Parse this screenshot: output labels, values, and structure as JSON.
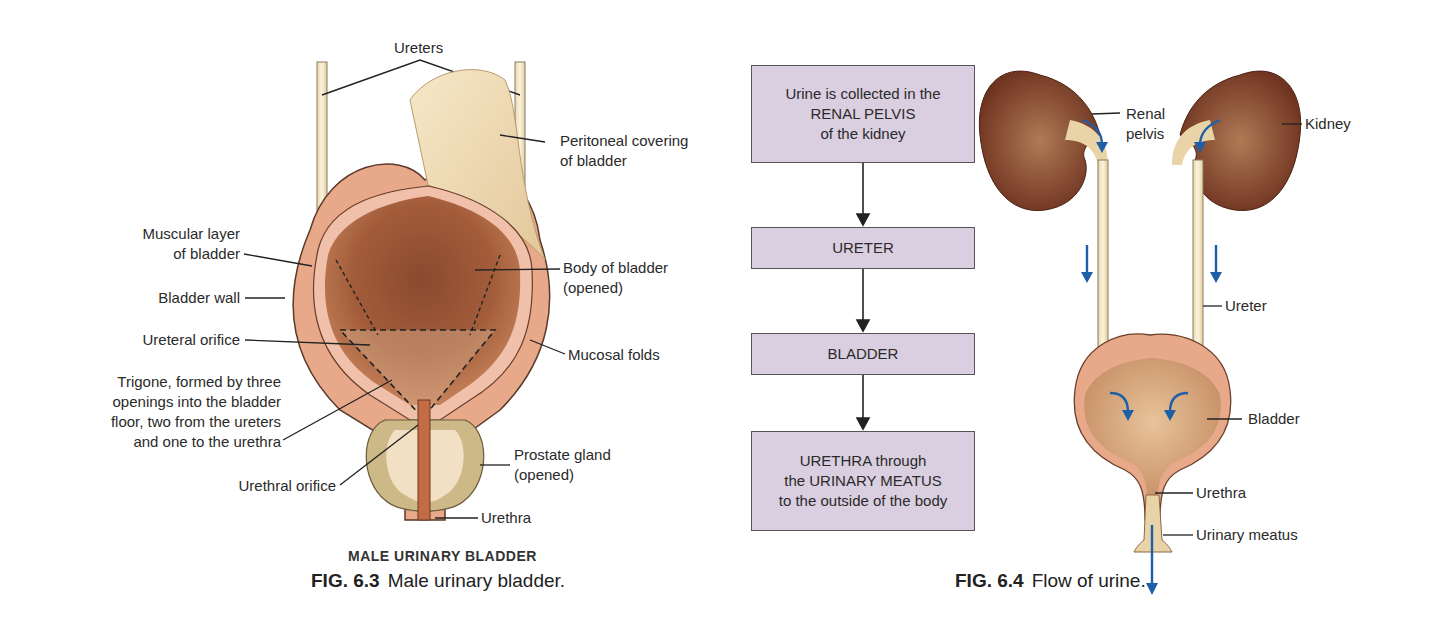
{
  "figure_6_3": {
    "subtitle": "MALE URINARY BLADDER",
    "caption_number": "FIG. 6.3",
    "caption_text": "Male urinary bladder.",
    "labels": {
      "ureters": "Ureters",
      "peritoneal": "Peritoneal covering\nof bladder",
      "muscular": "Muscular layer\nof bladder",
      "body": "Body of bladder\n(opened)",
      "wall": "Bladder wall",
      "ureteral_orifice": "Ureteral orifice",
      "mucosal": "Mucosal folds",
      "trigone": "Trigone, formed by three\nopenings into the bladder\nfloor, two from the ureters\nand one to the urethra",
      "prostate": "Prostate gland\n(opened)",
      "urethral_orifice": "Urethral orifice",
      "urethra": "Urethra"
    }
  },
  "flowchart": {
    "steps": [
      "Urine is collected in the\nRENAL PELVIS\nof the kidney",
      "URETER",
      "BLADDER",
      "URETHRA through\nthe URINARY MEATUS\nto the outside of the body"
    ]
  },
  "figure_6_4": {
    "caption_number": "FIG. 6.4",
    "caption_text": "Flow of urine.",
    "labels": {
      "renal_pelvis": "Renal\npelvis",
      "kidney": "Kidney",
      "ureter": "Ureter",
      "bladder": "Bladder",
      "urethra": "Urethra",
      "meatus": "Urinary meatus"
    }
  },
  "colors": {
    "flowbox": "#d9cfe0",
    "flow_arrow": "#1f5fa8",
    "kidney": "#7a3a24",
    "bladder_inner": "#b06a45"
  }
}
